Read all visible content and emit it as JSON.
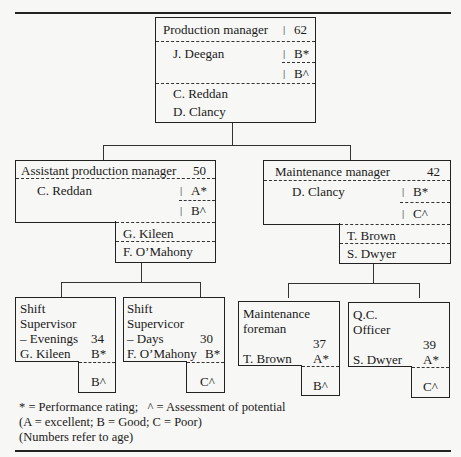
{
  "chart": {
    "top": {
      "title": "Production manager",
      "age": "62",
      "name": "J. Deegan",
      "performance": "B*",
      "potential": "B^",
      "successors": [
        "C. Reddan",
        "D. Clancy"
      ]
    },
    "level2": [
      {
        "title": "Assistant production manager",
        "age": "50",
        "name": "C. Reddan",
        "performance": "A*",
        "potential": "B^",
        "successors": [
          "G. Kileen",
          "F. O’Mahony"
        ]
      },
      {
        "title": "Maintenance manager",
        "age": "42",
        "name": "D. Clancy",
        "performance": "B*",
        "potential": "C^",
        "successors": [
          "T. Brown",
          "S. Dwyer"
        ]
      }
    ],
    "level3": [
      {
        "title_lines": [
          "Shift",
          "Supervisor",
          "– Evenings"
        ],
        "age": "34",
        "name": "G. Kileen",
        "performance": "B*",
        "potential": "B^"
      },
      {
        "title_lines": [
          "Shift",
          "Supervicor",
          "– Days"
        ],
        "age": "30",
        "name": "F. O’Mahony",
        "performance": "B*",
        "potential": "C^"
      },
      {
        "title_lines": [
          "Maintenance",
          "foreman"
        ],
        "age": "37",
        "name": "T. Brown",
        "performance": "A*",
        "potential": "B^"
      },
      {
        "title_lines": [
          "Q.C.",
          "Officer"
        ],
        "age": "39",
        "name": "S. Dwyer",
        "performance": "A*",
        "potential": "C^"
      }
    ]
  },
  "legend": {
    "line1": "* = Performance rating;   ^ = Assessment of potential",
    "line2": "(A = excellent; B = Good; C = Poor)",
    "line3": "(Numbers refer to age)"
  },
  "separator": "|"
}
